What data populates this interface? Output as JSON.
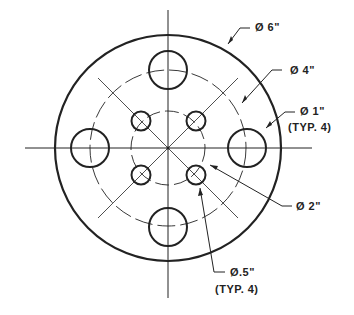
{
  "drawing": {
    "labels": {
      "outer": "Ø 6\"",
      "bolt_circle": "Ø 4\"",
      "large_hole": "Ø 1\"",
      "large_hole_note": "(TYP. 4)",
      "inner_circle": "Ø 2\"",
      "small_hole": "Ø.5\"",
      "small_hole_note": "(TYP. 4)"
    }
  }
}
